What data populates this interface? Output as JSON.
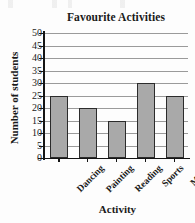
{
  "chart_data": {
    "type": "bar",
    "title": "Favourite Activities",
    "xlabel": "Activity",
    "ylabel": "Number of students",
    "categories": [
      "Dancing",
      "Painting",
      "Reading",
      "Sports",
      "Music"
    ],
    "values": [
      25,
      20,
      15,
      30,
      25
    ],
    "ylim": [
      0,
      50
    ],
    "ytick_step": 5,
    "yticks": [
      0,
      5,
      10,
      15,
      20,
      25,
      30,
      35,
      40,
      45,
      50
    ],
    "ytick_labels": [
      "0",
      "5",
      "10",
      "15",
      "20",
      "25",
      "30",
      "35",
      "40",
      "45",
      "50"
    ],
    "grid": true,
    "grid_axis": "y",
    "legend": false,
    "bar_fill_color": "#a9a9a9",
    "bar_edge_color": "#2b2b2b",
    "gridline_color": "#9a9a9a",
    "axis_color": "#141414",
    "background_color": "#fdfdfd",
    "xtick_label_rotation": -45,
    "series": [
      {
        "name": "Number of students",
        "values": [
          25,
          20,
          15,
          30,
          25
        ]
      }
    ]
  }
}
